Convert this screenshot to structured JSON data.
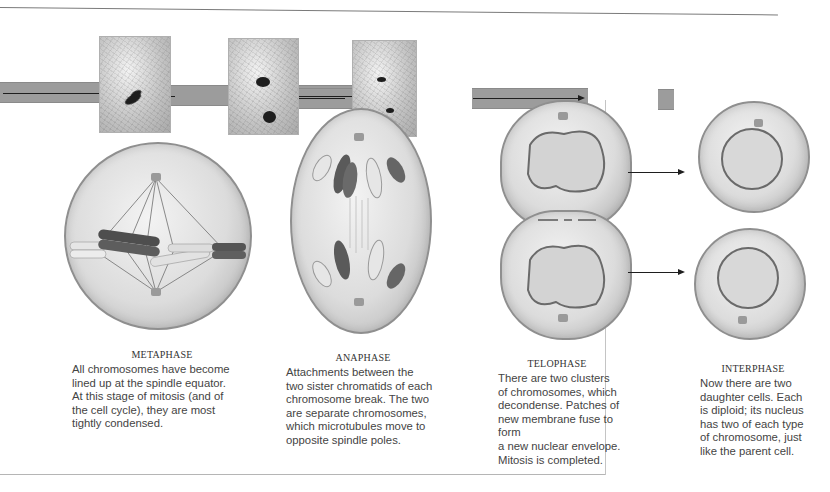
{
  "figure": {
    "stages": [
      {
        "id": "metaphase",
        "title": "METAPHASE",
        "lines": [
          "All chromosomes have become",
          "lined up at the spindle equator.",
          "At this stage of mitosis (and of",
          "the cell cycle), they are most",
          "tightly condensed."
        ]
      },
      {
        "id": "anaphase",
        "title": "ANAPHASE",
        "lines": [
          "Attachments between the",
          "two sister chromatids of each",
          "chromosome break. The two",
          "are separate chromosomes,",
          "which microtubules move to",
          "opposite spindle poles."
        ]
      },
      {
        "id": "telophase",
        "title": "TELOPHASE",
        "lines": [
          "There are two clusters",
          "of chromosomes, which",
          "decondense. Patches of",
          "new membrane fuse to form",
          "a new nuclear envelope.",
          "Mitosis is completed."
        ]
      },
      {
        "id": "interphase",
        "title": "INTERPHASE",
        "lines": [
          "Now there are two",
          "daughter cells. Each",
          "is diploid; its nucleus",
          "has two of each type",
          "of chromosome, just",
          "like the parent cell."
        ]
      }
    ],
    "micrographs": [
      "metaphase-micrograph",
      "anaphase-micrograph",
      "telophase-micrograph"
    ],
    "colors": {
      "band": "#9c9c9c",
      "arrow": "#1e1e1e",
      "cell_fill": "#d8d8d8",
      "dark_chromosome": "#4a4a4a",
      "light_chromosome": "#e4e4e4"
    }
  }
}
